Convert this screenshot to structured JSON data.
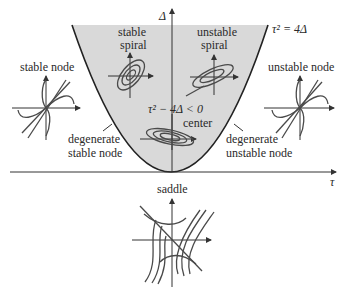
{
  "diagram": {
    "axes": {
      "vertical_label": "Δ",
      "horizontal_label": "τ"
    },
    "boundary_curve": {
      "label": "τ² = 4Δ"
    },
    "region_inequality": "τ² − 4Δ < 0",
    "colors": {
      "shaded_region": "#d9d9d9",
      "lines": "#2a2a2a",
      "background": "#ffffff"
    },
    "regions": [
      {
        "id": "stable_spiral",
        "line1": "stable",
        "line2": "spiral"
      },
      {
        "id": "unstable_spiral",
        "line1": "unstable",
        "line2": "spiral"
      },
      {
        "id": "center",
        "label": "center"
      },
      {
        "id": "stable_node",
        "label": "stable node"
      },
      {
        "id": "unstable_node",
        "label": "unstable node"
      },
      {
        "id": "degenerate_stable_node",
        "line1": "degenerate",
        "line2": "stable node"
      },
      {
        "id": "degenerate_unstable_node",
        "line1": "degenerate",
        "line2": "unstable node"
      },
      {
        "id": "saddle",
        "label": "saddle"
      }
    ]
  }
}
